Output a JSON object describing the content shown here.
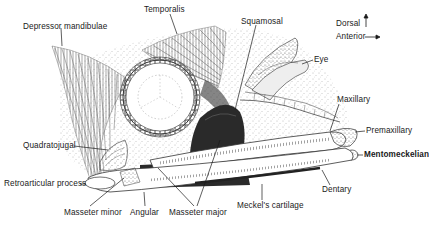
{
  "figure": {
    "type": "anatomical-illustration",
    "orientation": {
      "dorsal_label": "Dorsal",
      "anterior_label": "Anterior"
    },
    "colors": {
      "ink": "#1a1a1a",
      "background": "#ffffff",
      "muscle_dark": "#2a2a2a",
      "stipple": "#8a8a8a"
    },
    "labels": [
      {
        "id": "depressor-mandibulae",
        "text": "Depressor mandibulae",
        "x": 23,
        "y": 23
      },
      {
        "id": "temporalis",
        "text": "Temporalis",
        "x": 144,
        "y": 6
      },
      {
        "id": "squamosal",
        "text": "Squamosal",
        "x": 241,
        "y": 18
      },
      {
        "id": "eye",
        "text": "Eye",
        "x": 314,
        "y": 56
      },
      {
        "id": "maxillary",
        "text": "Maxillary",
        "x": 337,
        "y": 96
      },
      {
        "id": "premaxillary",
        "text": "Premaxillary",
        "x": 366,
        "y": 128
      },
      {
        "id": "mentomeckelian",
        "text": "Mentomeckelian",
        "x": 364,
        "y": 152
      },
      {
        "id": "dentary",
        "text": "Dentary",
        "x": 322,
        "y": 186
      },
      {
        "id": "meckels-cartilage",
        "text": "Meckel's cartilage",
        "x": 237,
        "y": 203
      },
      {
        "id": "masseter-major",
        "text": "Masseter major",
        "x": 169,
        "y": 209
      },
      {
        "id": "angular",
        "text": "Angular",
        "x": 130,
        "y": 209
      },
      {
        "id": "masseter-minor",
        "text": "Masseter minor",
        "x": 64,
        "y": 209
      },
      {
        "id": "retroarticular-process",
        "text": "Retroarticular process",
        "x": 4,
        "y": 181
      },
      {
        "id": "quadratojugal",
        "text": "Quadratojugal",
        "x": 23,
        "y": 143
      }
    ]
  }
}
